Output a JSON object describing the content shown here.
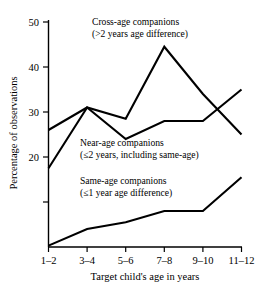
{
  "chart_data": {
    "type": "line",
    "title": "",
    "xlabel": "Target child's age in years",
    "ylabel": "Percentage of observations",
    "categories": [
      "1–2",
      "3–4",
      "5–6",
      "7–8",
      "9–10",
      "11–12"
    ],
    "ylim": [
      0,
      52
    ],
    "xlim": [
      0,
      5
    ],
    "ytick_values": [
      20,
      30,
      40,
      50
    ],
    "ytick_labels": [
      "20",
      "30",
      "40",
      "50"
    ],
    "yticks_unlabeled": [
      10
    ],
    "grid": false,
    "legend_position": "in-plot annotations",
    "series": [
      {
        "name": "Cross-age companions",
        "values": [
          26,
          31,
          28.5,
          44.5,
          34,
          25
        ]
      },
      {
        "name": "Near-age companions",
        "values": [
          17.5,
          31,
          24,
          28,
          28,
          35
        ]
      },
      {
        "name": "Same-age companions",
        "values": [
          0.3,
          4,
          5.5,
          8,
          8,
          15.5
        ]
      }
    ],
    "annotations": [
      {
        "name": "cross-age-label",
        "line1": "Cross-age companions",
        "line2": "(>2 years age difference)"
      },
      {
        "name": "near-age-label",
        "line1": "Near-age companions",
        "line2": "(≤2 years, including same-age)"
      },
      {
        "name": "same-age-label",
        "line1": "Same-age companions",
        "line2": "(≤1 year age difference)"
      }
    ]
  }
}
